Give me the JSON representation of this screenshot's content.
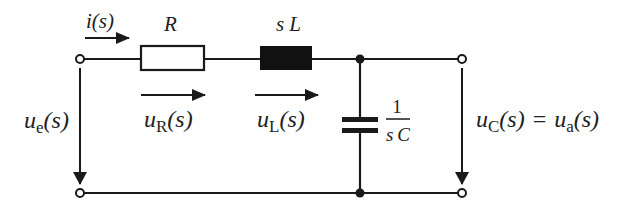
{
  "diagram": {
    "type": "RLC series circuit (Laplace domain)",
    "colors": {
      "wire": "#1a1a1a",
      "background": "#ffffff"
    },
    "components": {
      "resistor": {
        "label": "R"
      },
      "inductor": {
        "label_s": "s",
        "label_L": "L"
      },
      "capacitor": {
        "numerator": "1",
        "denominator_s": "s",
        "denominator_C": "C"
      }
    },
    "labels": {
      "current": {
        "sym": "i",
        "arg": "(s)"
      },
      "u_e": {
        "sym": "u",
        "sub": "e",
        "arg": "(s)"
      },
      "u_R": {
        "sym": "u",
        "sub": "R",
        "arg": "(s)"
      },
      "u_L": {
        "sym": "u",
        "sub": "L",
        "arg": "(s)"
      },
      "u_C": {
        "sym": "u",
        "sub": "C",
        "arg": "(s)",
        "eq": "=",
        "sym2": "u",
        "sub2": "a",
        "arg2": "(s)"
      }
    }
  }
}
